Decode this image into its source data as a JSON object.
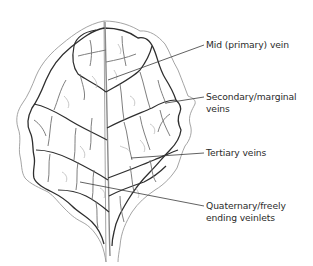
{
  "diagram": {
    "colors": {
      "outline": "#9a9a9a",
      "primary_vein": "#8a8a8a",
      "secondary_vein": "#2e2e2e",
      "tertiary_vein": "#707070",
      "quaternary_vein": "#b0b0b0",
      "leader_line": "#3a3a3a",
      "text": "#2b2b2b"
    },
    "labels": [
      {
        "id": "mid",
        "lines": [
          "Mid (primary) vein"
        ]
      },
      {
        "id": "secondary",
        "lines": [
          "Secondary/marginal",
          "veins"
        ]
      },
      {
        "id": "tertiary",
        "lines": [
          "Tertiary veins"
        ]
      },
      {
        "id": "quaternary",
        "lines": [
          "Quaternary/freely",
          "ending veinlets"
        ]
      }
    ]
  }
}
